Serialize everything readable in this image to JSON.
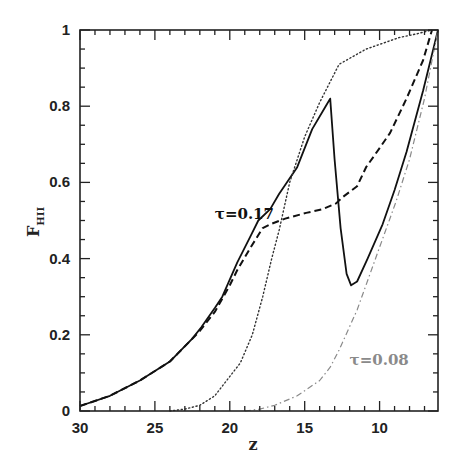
{
  "chart_data": {
    "type": "line",
    "title": "",
    "xlabel": "z",
    "ylabel": "F",
    "ylabel_subscript": "HII",
    "xlim": [
      30,
      6.1
    ],
    "ylim": [
      0,
      1
    ],
    "x_reversed": true,
    "grid": false,
    "legend": "none",
    "x_ticks": [
      30,
      25,
      20,
      15,
      10
    ],
    "x_tick_labels": [
      "30",
      "25",
      "20",
      "15",
      "10"
    ],
    "y_ticks": [
      0,
      0.2,
      0.4,
      0.6,
      0.8,
      1
    ],
    "y_tick_labels": [
      "0",
      "0.2",
      "0.4",
      "0.6",
      "0.8",
      "1"
    ],
    "annotations": [
      {
        "text": "τ=0.17",
        "z": 21.0,
        "F": 0.505,
        "color": "#111111"
      },
      {
        "text": "τ=0.08",
        "z": 12.0,
        "F": 0.12,
        "color": "#8a8a8a"
      }
    ],
    "series": [
      {
        "name": "solid (τ=0.17)",
        "style": "solid",
        "color": "#111111",
        "x": [
          30,
          28,
          26,
          24,
          23.5,
          22.5,
          21.9,
          21,
          20.5,
          19.5,
          18.6,
          18.1,
          17.3,
          16.7,
          15.5,
          14.5,
          13.6,
          13.3,
          13.0,
          12.6,
          12.2,
          11.9,
          11.5,
          10.8,
          9.8,
          9.0,
          8.2,
          7.1,
          6.1
        ],
        "y": [
          0.013,
          0.04,
          0.08,
          0.13,
          0.15,
          0.19,
          0.22,
          0.27,
          0.3,
          0.39,
          0.46,
          0.5,
          0.53,
          0.57,
          0.64,
          0.74,
          0.8,
          0.82,
          0.66,
          0.48,
          0.36,
          0.33,
          0.34,
          0.4,
          0.49,
          0.58,
          0.68,
          0.84,
          1.0
        ]
      },
      {
        "name": "dashed",
        "style": "dashed",
        "color": "#111111",
        "x": [
          30,
          28,
          26,
          24,
          23.5,
          22,
          21,
          20,
          19.5,
          18.6,
          17.8,
          17.3,
          16.3,
          14.9,
          13.8,
          12.9,
          12.5,
          11.5,
          10.9,
          10.0,
          9.3,
          8.2,
          7.1,
          6.5
        ],
        "y": [
          0.013,
          0.04,
          0.08,
          0.13,
          0.15,
          0.21,
          0.26,
          0.33,
          0.37,
          0.43,
          0.48,
          0.49,
          0.505,
          0.52,
          0.53,
          0.545,
          0.56,
          0.59,
          0.64,
          0.69,
          0.73,
          0.82,
          0.92,
          1.0
        ]
      },
      {
        "name": "dotted",
        "style": "dotted",
        "color": "#333333",
        "x": [
          24.0,
          23.0,
          22.0,
          21.0,
          20.7,
          19.3,
          18.5,
          17.8,
          17.2,
          16.7,
          16.0,
          15.0,
          14.0,
          12.7,
          10.9,
          8.7,
          7.5,
          6.5
        ],
        "y": [
          0.0,
          0.005,
          0.015,
          0.04,
          0.055,
          0.126,
          0.2,
          0.3,
          0.4,
          0.475,
          0.6,
          0.72,
          0.81,
          0.91,
          0.95,
          0.98,
          0.99,
          1.0
        ]
      },
      {
        "name": "dash-dot (τ=0.08)",
        "style": "dashdot",
        "color": "#8a8a8a",
        "x": [
          19.0,
          18.0,
          17.0,
          15.5,
          14.0,
          13.3,
          12.7,
          11.5,
          10.0,
          8.9,
          8.0,
          7.0,
          6.1
        ],
        "y": [
          0.0,
          0.005,
          0.015,
          0.04,
          0.08,
          0.115,
          0.16,
          0.265,
          0.43,
          0.55,
          0.66,
          0.82,
          1.0
        ]
      }
    ]
  }
}
